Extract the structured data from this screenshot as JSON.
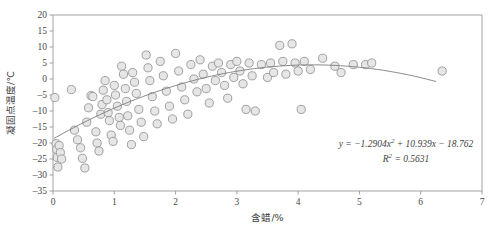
{
  "chart_data": {
    "type": "scatter",
    "title": "",
    "xlabel": "含蜡/%",
    "ylabel": "凝固点温度/℃",
    "xlim": [
      0,
      7
    ],
    "ylim": [
      -35,
      20
    ],
    "xticks": [
      0,
      1,
      2,
      3,
      4,
      5,
      6,
      7
    ],
    "xtick_labels": [
      "0",
      "1",
      "2",
      "3",
      "4",
      "5",
      "6",
      "7"
    ],
    "yticks": [
      20,
      15,
      10,
      5,
      0,
      -5,
      -10,
      -15,
      -20,
      -25,
      -30,
      -35
    ],
    "ytick_labels": [
      "20",
      "15",
      "10",
      "5",
      "0",
      "-5",
      "-10",
      "-15",
      "-20",
      "-25",
      "-30",
      "-35"
    ],
    "grid": false,
    "legend": "none",
    "marker": {
      "shape": "circle",
      "fill_color": "#e6e6e6",
      "edge_color": "#8c8c8c",
      "radius": 4.1
    },
    "trendline": {
      "type": "quadratic",
      "color": "#7a7a7a",
      "coefficients": {
        "a": -1.2904,
        "b": 10.939,
        "c": -18.762
      },
      "x_start": 0.02,
      "x_end": 6.25
    },
    "annotations": [
      {
        "name": "regression-equation",
        "text": "y=-1.2904x2+10.939x-18.762",
        "display": "y = −1.2904x² + 10.939x − 18.762",
        "x": 406,
        "y": 147
      },
      {
        "name": "r-squared",
        "text": "R2=0.5631",
        "display": "R² = 0.5631",
        "x": 406,
        "y": 162
      }
    ],
    "points": [
      [
        0.03,
        -5.8
      ],
      [
        0.05,
        -20.2
      ],
      [
        0.06,
        -22.0
      ],
      [
        0.07,
        -24.5
      ],
      [
        0.08,
        -27.5
      ],
      [
        0.1,
        -20.8
      ],
      [
        0.12,
        -23.0
      ],
      [
        0.14,
        -25.0
      ],
      [
        0.3,
        -3.3
      ],
      [
        0.35,
        -16.0
      ],
      [
        0.4,
        -19.0
      ],
      [
        0.45,
        -21.5
      ],
      [
        0.48,
        -24.8
      ],
      [
        0.52,
        -27.8
      ],
      [
        0.55,
        -13.5
      ],
      [
        0.58,
        -9.0
      ],
      [
        0.62,
        -5.2
      ],
      [
        0.65,
        -5.5
      ],
      [
        0.7,
        -16.5
      ],
      [
        0.72,
        -20.0
      ],
      [
        0.75,
        -22.5
      ],
      [
        0.78,
        -11.0
      ],
      [
        0.8,
        -8.0
      ],
      [
        0.82,
        -3.5
      ],
      [
        0.85,
        -0.5
      ],
      [
        0.88,
        -6.5
      ],
      [
        0.9,
        -10.5
      ],
      [
        0.92,
        -13.0
      ],
      [
        0.95,
        -17.5
      ],
      [
        0.98,
        -19.5
      ],
      [
        1.0,
        -2.0
      ],
      [
        1.02,
        -5.0
      ],
      [
        1.05,
        -8.5
      ],
      [
        1.08,
        -12.0
      ],
      [
        1.1,
        -14.5
      ],
      [
        1.12,
        4.0
      ],
      [
        1.15,
        1.5
      ],
      [
        1.18,
        -3.0
      ],
      [
        1.2,
        -7.0
      ],
      [
        1.22,
        -11.5
      ],
      [
        1.25,
        -16.0
      ],
      [
        1.28,
        -20.5
      ],
      [
        1.3,
        2.0
      ],
      [
        1.33,
        -1.0
      ],
      [
        1.36,
        -4.5
      ],
      [
        1.4,
        -9.5
      ],
      [
        1.44,
        -13.5
      ],
      [
        1.48,
        -18.0
      ],
      [
        1.52,
        7.5
      ],
      [
        1.55,
        3.5
      ],
      [
        1.58,
        -0.5
      ],
      [
        1.62,
        -5.5
      ],
      [
        1.66,
        -10.0
      ],
      [
        1.7,
        -14.0
      ],
      [
        1.75,
        5.5
      ],
      [
        1.8,
        1.0
      ],
      [
        1.85,
        -3.8
      ],
      [
        1.9,
        -8.5
      ],
      [
        1.95,
        -12.5
      ],
      [
        2.0,
        8.0
      ],
      [
        2.05,
        2.5
      ],
      [
        2.1,
        -2.5
      ],
      [
        2.15,
        -6.5
      ],
      [
        2.2,
        -11.0
      ],
      [
        2.25,
        4.5
      ],
      [
        2.3,
        0.0
      ],
      [
        2.35,
        -4.0
      ],
      [
        2.4,
        6.0
      ],
      [
        2.45,
        1.5
      ],
      [
        2.5,
        -3.0
      ],
      [
        2.55,
        -7.5
      ],
      [
        2.6,
        4.0
      ],
      [
        2.65,
        -0.5
      ],
      [
        2.7,
        5.0
      ],
      [
        2.75,
        2.0
      ],
      [
        2.8,
        -2.0
      ],
      [
        2.85,
        -6.0
      ],
      [
        2.9,
        4.5
      ],
      [
        2.95,
        0.5
      ],
      [
        3.0,
        5.5
      ],
      [
        3.05,
        2.5
      ],
      [
        3.1,
        -1.5
      ],
      [
        3.15,
        -9.5
      ],
      [
        3.2,
        5.0
      ],
      [
        3.25,
        1.0
      ],
      [
        3.3,
        -10.0
      ],
      [
        3.4,
        4.5
      ],
      [
        3.5,
        0.5
      ],
      [
        3.55,
        5.0
      ],
      [
        3.6,
        2.0
      ],
      [
        3.7,
        10.5
      ],
      [
        3.75,
        5.5
      ],
      [
        3.8,
        1.5
      ],
      [
        3.9,
        11.0
      ],
      [
        3.95,
        5.0
      ],
      [
        4.0,
        2.5
      ],
      [
        4.05,
        -9.5
      ],
      [
        4.1,
        5.5
      ],
      [
        4.2,
        3.0
      ],
      [
        4.4,
        6.5
      ],
      [
        4.6,
        4.0
      ],
      [
        4.7,
        2.0
      ],
      [
        4.9,
        4.5
      ],
      [
        5.1,
        4.5
      ],
      [
        5.2,
        5.0
      ],
      [
        6.35,
        2.5
      ]
    ]
  },
  "figure": {
    "plot_area": {
      "left": 53,
      "top": 15,
      "right": 482,
      "bottom": 191
    },
    "background": "#ffffff",
    "frame_color": "#999999"
  }
}
